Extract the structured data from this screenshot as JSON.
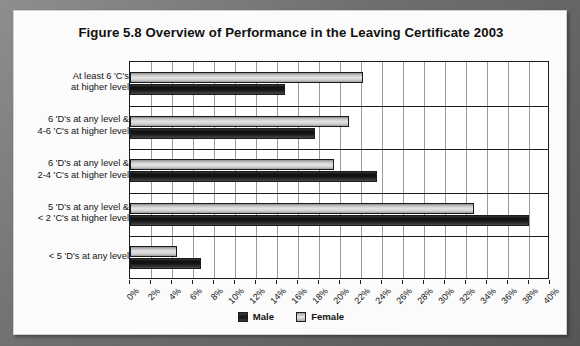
{
  "chart_data": {
    "type": "bar",
    "orientation": "horizontal",
    "title": "Figure 5.8 Overview of Performance in the Leaving Certificate 2003",
    "xlabel": "",
    "ylabel": "",
    "xlim": [
      0,
      40
    ],
    "xtick_labels": [
      "0%",
      "2%",
      "4%",
      "6%",
      "8%",
      "10%",
      "12%",
      "14%",
      "16%",
      "18%",
      "20%",
      "22%",
      "24%",
      "26%",
      "28%",
      "30%",
      "32%",
      "34%",
      "36%",
      "38%",
      "40%"
    ],
    "xtick_values": [
      0,
      2,
      4,
      6,
      8,
      10,
      12,
      14,
      16,
      18,
      20,
      22,
      24,
      26,
      28,
      30,
      32,
      34,
      36,
      38,
      40
    ],
    "grid": true,
    "legend_position": "bottom",
    "categories": [
      {
        "line1": "At least 6 'C's",
        "line2": "at higher level"
      },
      {
        "line1": "6 'D's at any level &",
        "line2": "4-6 'C's at higher level"
      },
      {
        "line1": "6 'D's at any level &",
        "line2": "2-4 'C's at higher level"
      },
      {
        "line1": "5 'D's at any level &",
        "line2": "< 2 'C's at higher level"
      },
      {
        "line1": "< 5 'D's at any level",
        "line2": ""
      }
    ],
    "series": [
      {
        "name": "Female",
        "color": "#d9d9d9",
        "values": [
          22.2,
          20.9,
          19.4,
          32.8,
          4.5
        ]
      },
      {
        "name": "Male",
        "color": "#141414",
        "values": [
          14.8,
          17.6,
          23.5,
          38.0,
          6.8
        ]
      }
    ]
  },
  "legend": {
    "items": [
      {
        "label": "Male",
        "key": "male"
      },
      {
        "label": "Female",
        "key": "female"
      }
    ]
  }
}
